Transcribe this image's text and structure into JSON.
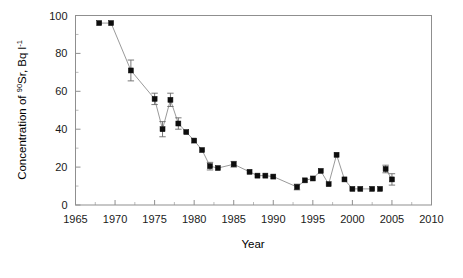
{
  "chart_data": {
    "type": "scatter",
    "title": "",
    "xlabel": "Year",
    "ylabel_text": "Concentration of ",
    "ylabel_sup_1": "90",
    "ylabel_mid": "Sr, Bq l",
    "ylabel_sup_2": "-1",
    "ylabel_full": "Concentration of 90Sr, Bq l-1",
    "xlim": [
      1965,
      2010
    ],
    "ylim": [
      0,
      100
    ],
    "xticks": [
      1965,
      1970,
      1975,
      1980,
      1985,
      1990,
      1995,
      2000,
      2005,
      2010
    ],
    "yticks": [
      0,
      20,
      40,
      60,
      80,
      100
    ],
    "xtick_labels": [
      "1965",
      "1970",
      "1975",
      "1980",
      "1985",
      "1990",
      "1995",
      "2000",
      "2005",
      "2010"
    ],
    "ytick_labels": [
      "0",
      "20",
      "40",
      "60",
      "80",
      "100"
    ],
    "x_minor_interval": 2.5,
    "y_minor_interval": 10,
    "grid": false,
    "legend": false,
    "marker_style": "filled-square",
    "marker_color": "#0d0d0d",
    "line_color": "#9a9a9a",
    "errorbar_color": "#6a6a6a",
    "frame_color": "#8f8f8f",
    "connect_segments": [
      [
        0,
        1
      ],
      [
        1,
        2
      ],
      [
        2,
        3
      ],
      [
        3,
        4
      ],
      [
        4,
        5
      ],
      [
        5,
        6
      ],
      [
        6,
        7
      ],
      [
        7,
        8
      ],
      [
        8,
        9
      ],
      [
        9,
        10
      ],
      [
        10,
        11
      ],
      [
        11,
        12
      ],
      [
        12,
        13
      ],
      [
        13,
        14
      ],
      [
        14,
        15
      ],
      [
        15,
        16
      ],
      [
        16,
        17
      ],
      [
        17,
        18
      ],
      [
        18,
        19
      ],
      [
        19,
        20
      ],
      [
        20,
        21
      ],
      [
        21,
        22
      ],
      [
        22,
        23
      ],
      [
        23,
        24
      ],
      [
        24,
        25
      ],
      [
        25,
        26
      ],
      [
        28,
        29
      ]
    ],
    "series": [
      {
        "name": "Sr-90 concentration",
        "points": [
          {
            "x": 1968.0,
            "y": 96.0,
            "yerr": 0
          },
          {
            "x": 1969.5,
            "y": 96.0,
            "yerr": 0
          },
          {
            "x": 1972.0,
            "y": 71.0,
            "yerr": 5.5
          },
          {
            "x": 1975.0,
            "y": 56.0,
            "yerr": 3.0
          },
          {
            "x": 1976.0,
            "y": 40.0,
            "yerr": 4.0
          },
          {
            "x": 1977.0,
            "y": 55.5,
            "yerr": 3.5
          },
          {
            "x": 1978.0,
            "y": 43.0,
            "yerr": 3.0
          },
          {
            "x": 1979.0,
            "y": 38.5,
            "yerr": 0
          },
          {
            "x": 1980.0,
            "y": 34.0,
            "yerr": 0
          },
          {
            "x": 1981.0,
            "y": 29.0,
            "yerr": 0
          },
          {
            "x": 1982.0,
            "y": 20.5,
            "yerr": 2.0
          },
          {
            "x": 1983.0,
            "y": 19.5,
            "yerr": 0
          },
          {
            "x": 1985.0,
            "y": 21.5,
            "yerr": 1.5
          },
          {
            "x": 1987.0,
            "y": 17.5,
            "yerr": 0
          },
          {
            "x": 1988.0,
            "y": 15.5,
            "yerr": 0
          },
          {
            "x": 1989.0,
            "y": 15.5,
            "yerr": 0
          },
          {
            "x": 1990.0,
            "y": 15.0,
            "yerr": 0
          },
          {
            "x": 1993.0,
            "y": 9.5,
            "yerr": 1.5
          },
          {
            "x": 1994.0,
            "y": 13.0,
            "yerr": 0
          },
          {
            "x": 1995.0,
            "y": 14.0,
            "yerr": 0
          },
          {
            "x": 1996.0,
            "y": 18.0,
            "yerr": 0
          },
          {
            "x": 1997.0,
            "y": 11.0,
            "yerr": 0
          },
          {
            "x": 1998.0,
            "y": 26.5,
            "yerr": 0
          },
          {
            "x": 1999.0,
            "y": 13.5,
            "yerr": 0
          },
          {
            "x": 2000.0,
            "y": 8.5,
            "yerr": 0
          },
          {
            "x": 2001.0,
            "y": 8.5,
            "yerr": 0
          },
          {
            "x": 2002.5,
            "y": 8.5,
            "yerr": 0
          },
          {
            "x": 2003.5,
            "y": 8.5,
            "yerr": 0
          },
          {
            "x": 2004.2,
            "y": 19.0,
            "yerr": 2.0
          },
          {
            "x": 2005.0,
            "y": 13.5,
            "yerr": 3.0
          }
        ]
      }
    ]
  }
}
